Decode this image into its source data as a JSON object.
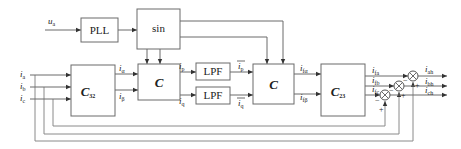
{
  "diagram": {
    "type": "block-diagram",
    "blocks": {
      "pll": {
        "label": "PLL"
      },
      "sin": {
        "label": "sin"
      },
      "c32": {
        "label": "C",
        "sub": "32"
      },
      "c1": {
        "label": "C"
      },
      "lpf1": {
        "label": "LPF"
      },
      "lpf2": {
        "label": "LPF"
      },
      "c2": {
        "label": "C"
      },
      "c23": {
        "label": "C",
        "sub": "23"
      }
    },
    "signals": {
      "ua": {
        "main": "u",
        "sub": "a"
      },
      "ia": {
        "main": "i",
        "sub": "a"
      },
      "ib": {
        "main": "i",
        "sub": "b"
      },
      "ic": {
        "main": "i",
        "sub": "c"
      },
      "ialpha": {
        "main": "i",
        "sub": "α"
      },
      "ibeta": {
        "main": "i",
        "sub": "β"
      },
      "ip": {
        "main": "i",
        "sub": "p"
      },
      "iq": {
        "main": "i",
        "sub": "q"
      },
      "ip_bar": {
        "main": "i",
        "sub": "p"
      },
      "iq_bar": {
        "main": "i",
        "sub": "q"
      },
      "ifalpha": {
        "main": "i",
        "sub": "fα"
      },
      "ifbeta": {
        "main": "i",
        "sub": "fβ"
      },
      "ifa": {
        "main": "i",
        "sub": "fa"
      },
      "ifb": {
        "main": "i",
        "sub": "fb"
      },
      "ifc": {
        "main": "i",
        "sub": "fc"
      },
      "iah": {
        "main": "i",
        "sub": "ah"
      },
      "ibh": {
        "main": "i",
        "sub": "bh"
      },
      "ich": {
        "main": "i",
        "sub": "ch"
      }
    },
    "summing_signs": {
      "minus": "−",
      "plus": "+"
    }
  }
}
